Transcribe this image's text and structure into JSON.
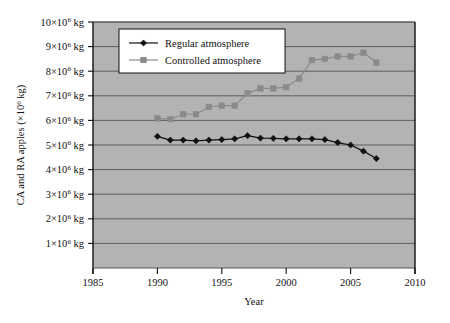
{
  "chart_data": {
    "type": "line",
    "title": "",
    "xlabel": "Year",
    "ylabel": "CA and RA apples (×10⁶ kg)",
    "xlim": [
      1985,
      2010
    ],
    "ylim": [
      0,
      10
    ],
    "grid": true,
    "grid_axis": "y",
    "legend_position": "top-left-inside",
    "plot_background": "#b3b3b3",
    "x_ticks": [
      1985,
      1990,
      1995,
      2000,
      2005,
      2010
    ],
    "x_tick_labels": [
      "1985",
      "1990",
      "1995",
      "2000",
      "2005",
      "2010"
    ],
    "y_ticks": [
      1,
      2,
      3,
      4,
      5,
      6,
      7,
      8,
      9,
      10
    ],
    "y_tick_labels": [
      "1×10⁶ kg",
      "2×10⁶ kg",
      "3×10⁶ kg",
      "4×10⁶ kg",
      "5×10⁶ kg",
      "6×10⁶ kg",
      "7×10⁶ kg",
      "8×10⁶ kg",
      "9×10⁶ kg",
      "10×10⁶ kg"
    ],
    "y_unit_note": "values in millions of kg (×10⁶ kg)",
    "series": [
      {
        "name": "Regular atmosphere",
        "marker": "diamond",
        "color": "#111111",
        "line_color": "#111111",
        "x": [
          1990,
          1991,
          1992,
          1993,
          1994,
          1995,
          1996,
          1997,
          1998,
          1999,
          2000,
          2001,
          2002,
          2003,
          2004,
          2005,
          2006,
          2007
        ],
        "values": [
          5.35,
          5.2,
          5.2,
          5.17,
          5.2,
          5.22,
          5.25,
          5.38,
          5.28,
          5.27,
          5.25,
          5.25,
          5.25,
          5.22,
          5.1,
          5.0,
          4.75,
          4.45
        ]
      },
      {
        "name": "Controlled atmosphere",
        "marker": "square",
        "color": "#8a8a8a",
        "line_color": "#8a8a8a",
        "x": [
          1990,
          1991,
          1992,
          1993,
          1994,
          1995,
          1996,
          1997,
          1998,
          1999,
          2000,
          2001,
          2002,
          2003,
          2004,
          2005,
          2006,
          2007
        ],
        "values": [
          6.08,
          6.05,
          6.25,
          6.25,
          6.55,
          6.6,
          6.6,
          7.1,
          7.3,
          7.3,
          7.35,
          7.7,
          8.45,
          8.5,
          8.6,
          8.6,
          8.75,
          8.35
        ]
      }
    ],
    "legend": [
      {
        "label": "Regular atmosphere",
        "marker": "diamond",
        "color": "#111111"
      },
      {
        "label": "Controlled atmosphere",
        "marker": "square",
        "color": "#8a8a8a"
      }
    ]
  }
}
